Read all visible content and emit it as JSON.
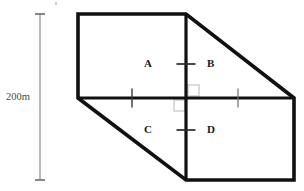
{
  "figure": {
    "canvas": {
      "width": 304,
      "height": 191
    },
    "colors": {
      "outline": "#111111",
      "divider": "#111111",
      "tick": "#333333",
      "right_angle_marker": "#c8c8c8",
      "dimension_line": "#7a7a7a",
      "label_text": "#1a1a1a",
      "dimension_text": "#4a4a4a",
      "background": "#ffffff"
    },
    "shape": {
      "name": "hexagon-outline",
      "description": "Rectangle with upper-right and lower-left corners cut by diagonals",
      "vertices": [
        {
          "name": "top-left",
          "x": 78,
          "y": 14
        },
        {
          "name": "top-mid",
          "x": 186,
          "y": 14
        },
        {
          "name": "right-mid",
          "x": 294,
          "y": 98
        },
        {
          "name": "bottom-right",
          "x": 294,
          "y": 180
        },
        {
          "name": "bottom-mid",
          "x": 186,
          "y": 180
        },
        {
          "name": "left-mid",
          "x": 78,
          "y": 98
        }
      ],
      "edges": [
        {
          "name": "top-edge",
          "from": "top-left",
          "to": "top-mid",
          "kind": "straight"
        },
        {
          "name": "upper-right-diagonal",
          "from": "top-mid",
          "to": "right-mid",
          "kind": "diagonal"
        },
        {
          "name": "right-edge",
          "from": "right-mid",
          "to": "bottom-right",
          "kind": "straight"
        },
        {
          "name": "bottom-edge",
          "from": "bottom-right",
          "to": "bottom-mid",
          "kind": "straight"
        },
        {
          "name": "lower-left-diagonal",
          "from": "bottom-mid",
          "to": "left-mid",
          "kind": "diagonal"
        },
        {
          "name": "left-edge",
          "from": "left-mid",
          "to": "top-left",
          "kind": "straight"
        }
      ]
    },
    "dividers": [
      {
        "name": "vertical-divider",
        "x1": 186,
        "y1": 14,
        "x2": 186,
        "y2": 180
      },
      {
        "name": "horizontal-divider",
        "x1": 78,
        "y1": 98,
        "x2": 294,
        "y2": 98
      }
    ],
    "intersection": {
      "x": 186,
      "y": 98
    },
    "right_angle_markers": [
      {
        "name": "right-angle-marker-upper-right",
        "x": 188,
        "y": 86,
        "size": 10
      },
      {
        "name": "right-angle-marker-lower-left",
        "x": 174,
        "y": 100,
        "size": 10
      }
    ],
    "tick_marks": [
      {
        "name": "tick-vertical-upper",
        "orientation": "horizontal-stroke",
        "cx": 186,
        "cy": 64,
        "length": 19,
        "weight": 1.6
      },
      {
        "name": "tick-vertical-lower",
        "orientation": "horizontal-stroke",
        "cx": 186,
        "cy": 130,
        "length": 19,
        "weight": 1.6
      },
      {
        "name": "tick-horizontal-left",
        "orientation": "vertical-stroke",
        "cx": 132,
        "cy": 98,
        "length": 19,
        "weight": 1.3
      },
      {
        "name": "tick-horizontal-right",
        "orientation": "vertical-stroke",
        "cx": 238,
        "cy": 98,
        "length": 19,
        "weight": 1.1
      }
    ],
    "region_labels": [
      {
        "id": "A",
        "text": "A",
        "x": 148,
        "y": 64
      },
      {
        "id": "B",
        "text": "B",
        "x": 211,
        "y": 64
      },
      {
        "id": "C",
        "text": "C",
        "x": 148,
        "y": 130
      },
      {
        "id": "D",
        "text": "D",
        "x": 211,
        "y": 130
      }
    ],
    "dimension": {
      "name": "left-height-dimension",
      "label": "200m",
      "value": 200,
      "unit": "m",
      "line": {
        "x": 40,
        "y_top": 14,
        "y_bottom": 180
      },
      "cap_half_width": 5
    }
  }
}
